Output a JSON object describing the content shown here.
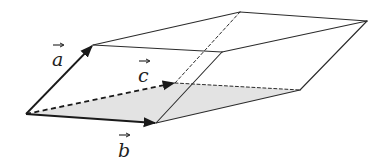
{
  "diagram": {
    "type": "parallelepiped",
    "vectors": [
      {
        "name": "a",
        "label": "a",
        "style": "solid"
      },
      {
        "name": "b",
        "label": "b",
        "style": "solid"
      },
      {
        "name": "c",
        "label": "c",
        "style": "dashed"
      }
    ],
    "shaded_face": [
      "b",
      "c"
    ],
    "hidden_edges_dashed": true,
    "colors": {
      "stroke": "#2b2b2b",
      "shade": "#e3e3e3",
      "background": "#ffffff"
    }
  }
}
